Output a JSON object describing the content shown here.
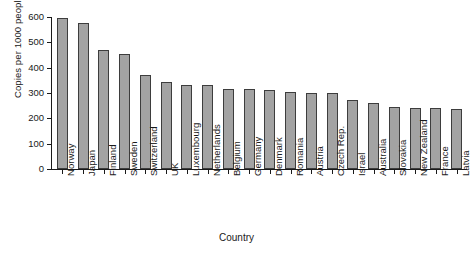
{
  "chart_data": {
    "type": "bar",
    "title": "",
    "xlabel": "Country",
    "ylabel": "Copies per 1000 people",
    "ylim": [
      0,
      600
    ],
    "yticks": [
      0,
      100,
      200,
      300,
      400,
      500,
      600
    ],
    "grid": false,
    "legend": null,
    "bar_color": "#a3a3a3",
    "bar_edge_color": "#3d3d3d",
    "categories": [
      "Norway",
      "Japan",
      "Finland",
      "Sweden",
      "Switzerland",
      "UK",
      "Luxembourg",
      "Netherlands",
      "Belgium",
      "Germany",
      "Denmark",
      "Romania",
      "Austria",
      "Czech Rep.",
      "Israel",
      "Australia",
      "Slovakia",
      "New Zealand",
      "France",
      "Latvia"
    ],
    "values": [
      597,
      575,
      468,
      455,
      372,
      345,
      333,
      331,
      317,
      315,
      310,
      303,
      302,
      300,
      271,
      259,
      243,
      242,
      239,
      238
    ]
  }
}
